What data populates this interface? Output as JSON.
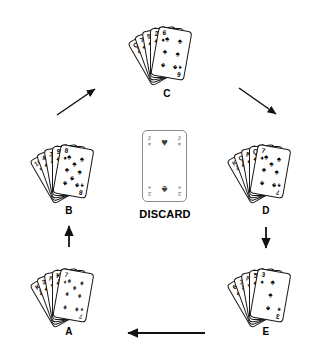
{
  "diagram": {
    "center": {
      "card_label": "DISCARD",
      "card": {
        "rank": "2",
        "suit_top": "heart",
        "suit_bottom": "spade",
        "suit_top_glyph": "♥",
        "suit_bottom_glyph": "♠"
      }
    },
    "hands": [
      {
        "id": "A",
        "label": "A",
        "cards": [
          {
            "rank": "K",
            "suit": "club",
            "glyph": "♣",
            "color": "black",
            "face": true
          },
          {
            "rank": "3",
            "suit": "club",
            "glyph": "♣",
            "color": "black",
            "face": false
          },
          {
            "rank": "A",
            "suit": "heart",
            "glyph": "♥",
            "color": "red",
            "face": false
          },
          {
            "rank": "K",
            "suit": "club",
            "glyph": "♣",
            "color": "black",
            "face": true
          },
          {
            "rank": "7",
            "suit": "diamond",
            "glyph": "♦",
            "color": "red",
            "face": false
          }
        ]
      },
      {
        "id": "B",
        "label": "B",
        "cards": [
          {
            "rank": "10",
            "suit": "heart",
            "glyph": "♥",
            "color": "red",
            "face": false
          },
          {
            "rank": "4",
            "suit": "club",
            "glyph": "♣",
            "color": "black",
            "face": false
          },
          {
            "rank": "J",
            "suit": "spade",
            "glyph": "♠",
            "color": "black",
            "face": true
          },
          {
            "rank": "9",
            "suit": "club",
            "glyph": "♣",
            "color": "black",
            "face": false
          },
          {
            "rank": "8",
            "suit": "spade",
            "glyph": "♠",
            "color": "black",
            "face": false
          }
        ]
      },
      {
        "id": "C",
        "label": "C",
        "cards": [
          {
            "rank": "Q",
            "suit": "club",
            "glyph": "♣",
            "color": "black",
            "face": true
          },
          {
            "rank": "7",
            "suit": "club",
            "glyph": "♣",
            "color": "black",
            "face": false
          },
          {
            "rank": "5",
            "suit": "club",
            "glyph": "♣",
            "color": "black",
            "face": false
          },
          {
            "rank": "2",
            "suit": "club",
            "glyph": "♣",
            "color": "black",
            "face": false
          },
          {
            "rank": "6",
            "suit": "spade",
            "glyph": "♠",
            "color": "black",
            "face": false
          }
        ]
      },
      {
        "id": "D",
        "label": "D",
        "cards": [
          {
            "rank": "K",
            "suit": "heart",
            "glyph": "♥",
            "color": "red",
            "face": true
          },
          {
            "rank": "Q",
            "suit": "club",
            "glyph": "♣",
            "color": "black",
            "face": true
          },
          {
            "rank": "A",
            "suit": "club",
            "glyph": "♣",
            "color": "black",
            "face": false
          },
          {
            "rank": "Q",
            "suit": "club",
            "glyph": "♣",
            "color": "black",
            "face": false
          },
          {
            "rank": "7",
            "suit": "spade",
            "glyph": "♠",
            "color": "black",
            "face": false
          }
        ]
      },
      {
        "id": "E",
        "label": "E",
        "cards": [
          {
            "rank": "6",
            "suit": "club",
            "glyph": "♣",
            "color": "black",
            "face": false
          },
          {
            "rank": "J",
            "suit": "heart",
            "glyph": "♥",
            "color": "red",
            "face": true
          },
          {
            "rank": "A",
            "suit": "heart",
            "glyph": "♥",
            "color": "red",
            "face": false
          },
          {
            "rank": "5",
            "suit": "club",
            "glyph": "♣",
            "color": "black",
            "face": false
          },
          {
            "rank": "3",
            "suit": "spade",
            "glyph": "♠",
            "color": "black",
            "face": false
          }
        ]
      }
    ],
    "arrows": [
      {
        "from": "A",
        "to": "B",
        "direction": "up"
      },
      {
        "from": "B",
        "to": "C",
        "direction": "up-right"
      },
      {
        "from": "C",
        "to": "D",
        "direction": "down-right"
      },
      {
        "from": "D",
        "to": "E",
        "direction": "down"
      },
      {
        "from": "E",
        "to": "A",
        "direction": "left"
      }
    ],
    "colors": {
      "ink": "#000000",
      "card_outline": "#1a1a1a",
      "discard_outline": "#8a8a8a",
      "background": "#ffffff"
    }
  }
}
